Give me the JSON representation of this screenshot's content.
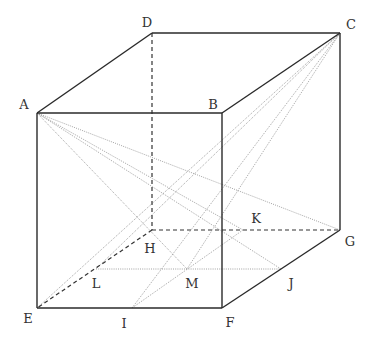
{
  "diagram": {
    "type": "cube-geometry",
    "vertices": {
      "A": {
        "x": 37,
        "y": 113,
        "label": "A",
        "lx": 24,
        "ly": 104
      },
      "B": {
        "x": 222,
        "y": 113,
        "label": "B",
        "lx": 213,
        "ly": 104
      },
      "C": {
        "x": 340,
        "y": 33,
        "label": "C",
        "lx": 351,
        "ly": 24
      },
      "D": {
        "x": 152,
        "y": 33,
        "label": "D",
        "lx": 147,
        "ly": 22
      },
      "E": {
        "x": 37,
        "y": 308,
        "label": "E",
        "lx": 28,
        "ly": 318
      },
      "F": {
        "x": 222,
        "y": 308,
        "label": "F",
        "lx": 230,
        "ly": 322
      },
      "G": {
        "x": 340,
        "y": 230,
        "label": "G",
        "lx": 350,
        "ly": 241
      },
      "H": {
        "x": 152,
        "y": 230,
        "label": "H",
        "lx": 150,
        "ly": 248
      },
      "I": {
        "x": 132,
        "y": 308,
        "label": "I",
        "lx": 124,
        "ly": 323
      },
      "J": {
        "x": 281,
        "y": 269,
        "label": "J",
        "lx": 291,
        "ly": 283
      },
      "K": {
        "x": 243,
        "y": 230,
        "label": "K",
        "lx": 256,
        "ly": 218
      },
      "L": {
        "x": 96,
        "y": 269,
        "label": "L",
        "lx": 96,
        "ly": 283
      },
      "M": {
        "x": 187,
        "y": 269,
        "label": "M",
        "lx": 192,
        "ly": 283
      }
    },
    "solid_edges": [
      [
        "A",
        "B"
      ],
      [
        "B",
        "C"
      ],
      [
        "C",
        "D"
      ],
      [
        "D",
        "A"
      ],
      [
        "A",
        "E"
      ],
      [
        "B",
        "F"
      ],
      [
        "C",
        "G"
      ],
      [
        "E",
        "F"
      ],
      [
        "F",
        "G"
      ]
    ],
    "dashed_edges": [
      [
        "D",
        "H"
      ],
      [
        "H",
        "G"
      ],
      [
        "H",
        "E"
      ]
    ],
    "dotted_lines": [
      [
        "A",
        "G"
      ],
      [
        "A",
        "K"
      ],
      [
        "A",
        "J"
      ],
      [
        "A",
        "M"
      ],
      [
        "C",
        "E"
      ],
      [
        "C",
        "L"
      ],
      [
        "C",
        "I"
      ],
      [
        "C",
        "M"
      ],
      [
        "L",
        "J"
      ],
      [
        "I",
        "K"
      ]
    ],
    "colors": {
      "solid": "#2a2a2a",
      "dashed": "#333333",
      "dotted": "#8a8a8a"
    }
  }
}
